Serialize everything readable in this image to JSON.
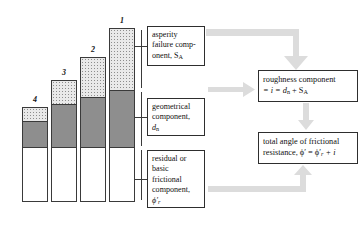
{
  "figure": {
    "type": "geotechnical-shear-strength-components-diagram",
    "background_color": "#ffffff",
    "bar_fill_asperity": "#e9e9e9",
    "bar_fill_geometrical": "#8e8e8e",
    "bar_fill_residual": "#ffffff",
    "arrow_color": "#d7d7d7",
    "outline_color": "#3a3a3a"
  },
  "bars": [
    {
      "label": "4",
      "label_x": 22,
      "label_y": 97,
      "x": 22,
      "y": 107,
      "width": 26,
      "height": 95,
      "asperity_height": 14,
      "geometrical_height": 26,
      "residual_height": 55
    },
    {
      "label": "3",
      "label_x": 51,
      "label_y": 70,
      "x": 51,
      "y": 80,
      "width": 26,
      "height": 122,
      "asperity_height": 24,
      "geometrical_height": 43,
      "residual_height": 55
    },
    {
      "label": "2",
      "label_x": 80,
      "label_y": 47,
      "x": 80,
      "y": 57,
      "width": 26,
      "height": 145,
      "asperity_height": 40,
      "geometrical_height": 50,
      "residual_height": 55
    },
    {
      "label": "1",
      "label_x": 109,
      "label_y": 18,
      "x": 109,
      "y": 28,
      "width": 26,
      "height": 174,
      "asperity_height": 62,
      "geometrical_height": 57,
      "residual_height": 55
    }
  ],
  "callouts": {
    "asperity": {
      "lines": [
        "asperity",
        "failure comp-",
        "onent, S"
      ],
      "subscript": "A",
      "box": {
        "x": 147,
        "y": 26,
        "width": 58,
        "height": 40
      }
    },
    "geometrical": {
      "lines": [
        "geometrical",
        "component,"
      ],
      "symbol": "d",
      "subscript": "n",
      "box": {
        "x": 147,
        "y": 98,
        "width": 58,
        "height": 38
      }
    },
    "residual": {
      "lines": [
        "residual or",
        "basic",
        "frictional",
        "component,"
      ],
      "symbol": "ϕ′",
      "subscript": "r",
      "box": {
        "x": 147,
        "y": 150,
        "width": 58,
        "height": 58
      }
    }
  },
  "results": {
    "roughness": {
      "line1": "roughness component",
      "line2_prefix": "= i = d",
      "line2_sub1": "n",
      "line2_mid": " + S",
      "line2_sub2": "A",
      "box": {
        "x": 258,
        "y": 70,
        "width": 100,
        "height": 32
      }
    },
    "total": {
      "line1": "total angle of frictional",
      "line2_prefix": "resistance,  ϕ′  =  ϕ′",
      "line2_sub": "r",
      "line2_suffix": " + i",
      "box": {
        "x": 258,
        "y": 132,
        "width": 100,
        "height": 32
      }
    }
  },
  "leaders": [
    {
      "name": "leader-asperity",
      "from_bar": "1",
      "to_box": "asperity"
    },
    {
      "name": "leader-geometrical",
      "from_bar": "1",
      "to_box": "geometrical"
    },
    {
      "name": "leader-residual",
      "from_bar": "1",
      "to_box": "residual"
    }
  ],
  "flow_arrows": [
    {
      "name": "arrow-asperity-to-roughness",
      "shape": "elbow-right-down"
    },
    {
      "name": "arrow-geometrical-to-roughness",
      "shape": "right"
    },
    {
      "name": "arrow-roughness-to-total",
      "shape": "down"
    },
    {
      "name": "arrow-residual-to-total",
      "shape": "elbow-right-up"
    }
  ]
}
